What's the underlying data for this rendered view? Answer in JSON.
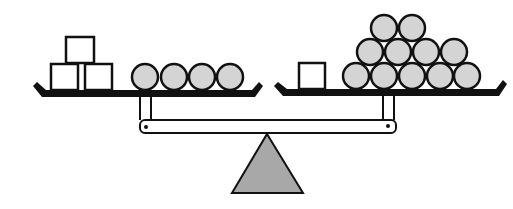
{
  "diagram": {
    "type": "balance-scale-puzzle",
    "colors": {
      "stroke": "#111111",
      "ball_fill": "#d4d4d4",
      "box_fill": "#ffffff",
      "fulcrum_fill": "#a8a8a8",
      "beam_fill": "#ffffff"
    },
    "left_pan": {
      "boxes": [
        {
          "x": 66,
          "y": 37,
          "w": 28,
          "h": 26
        },
        {
          "x": 51,
          "y": 64,
          "w": 27,
          "h": 26
        },
        {
          "x": 85,
          "y": 64,
          "w": 27,
          "h": 26
        }
      ],
      "balls": [
        {
          "cx": 145,
          "cy": 77
        },
        {
          "cx": 174,
          "cy": 77
        },
        {
          "cx": 202,
          "cy": 77
        },
        {
          "cx": 230,
          "cy": 77
        }
      ],
      "box_count": 3,
      "ball_count": 4
    },
    "right_pan": {
      "boxes": [
        {
          "x": 299,
          "y": 63,
          "w": 26,
          "h": 26
        }
      ],
      "balls": [
        {
          "cx": 356,
          "cy": 76
        },
        {
          "cx": 384,
          "cy": 76
        },
        {
          "cx": 412,
          "cy": 76
        },
        {
          "cx": 440,
          "cy": 76
        },
        {
          "cx": 467,
          "cy": 76
        },
        {
          "cx": 370,
          "cy": 52
        },
        {
          "cx": 398,
          "cy": 52
        },
        {
          "cx": 426,
          "cy": 52
        },
        {
          "cx": 454,
          "cy": 52
        },
        {
          "cx": 384,
          "cy": 28
        },
        {
          "cx": 412,
          "cy": 28
        }
      ],
      "box_count": 1,
      "ball_count": 11
    },
    "ball_radius": 13
  }
}
